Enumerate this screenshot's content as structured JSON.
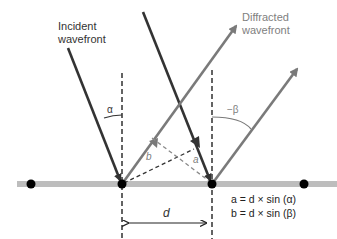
{
  "labels": {
    "incident_line1": "Incident",
    "incident_line2": "wavefront",
    "diffracted_line1": "Diffracted",
    "diffracted_line2": "wavefront",
    "alpha": "α",
    "neg_beta": "−β",
    "a": "a",
    "b": "b",
    "d": "d"
  },
  "equations": {
    "eq1": "a = d × sin (α)",
    "eq2": "b = d × sin (β)"
  },
  "colors": {
    "incident": "#333333",
    "diffracted": "#7a7a7a",
    "grating": "#bdbdbd",
    "dot": "#000000"
  }
}
